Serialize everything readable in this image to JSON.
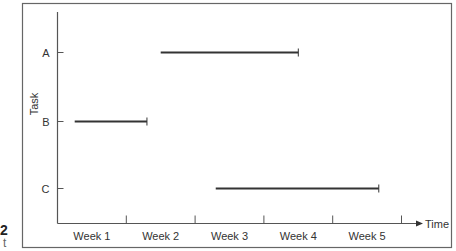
{
  "page_edge": {
    "left_number": "2",
    "left_caption": "t"
  },
  "chart_data": {
    "type": "gantt",
    "title": "",
    "xlabel": "Time",
    "ylabel": "Task",
    "categories": [
      "Week 1",
      "Week 2",
      "Week 3",
      "Week 4",
      "Week 5"
    ],
    "xlim": [
      0,
      5
    ],
    "grid": false,
    "legend": null,
    "tasks": [
      {
        "name": "A",
        "start": 1.5,
        "end": 3.5
      },
      {
        "name": "B",
        "start": 0.25,
        "end": 1.3
      },
      {
        "name": "C",
        "start": 2.3,
        "end": 4.67
      }
    ],
    "task_order_top_to_bottom": [
      "A",
      "B",
      "C"
    ]
  },
  "colors": {
    "bar": "#333333",
    "axis": "#555555",
    "frame": "#666666"
  }
}
